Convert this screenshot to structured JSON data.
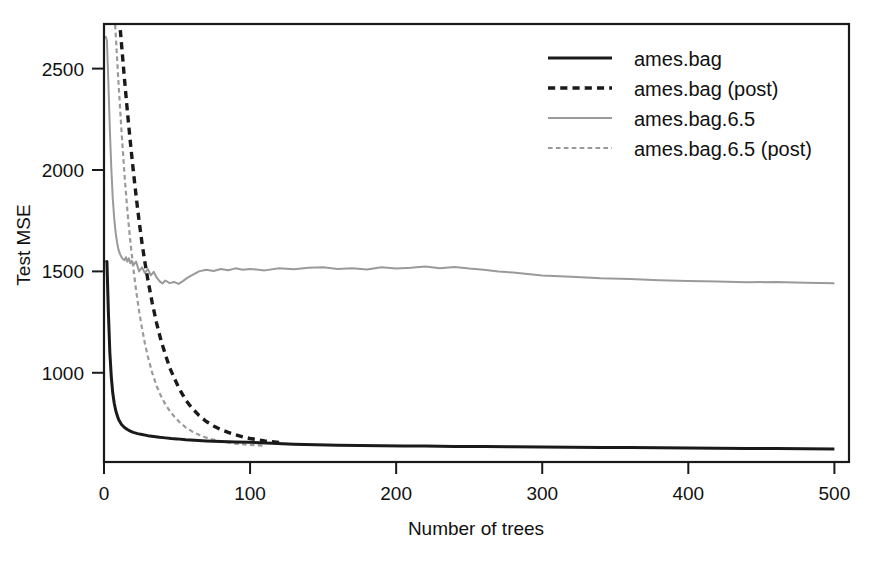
{
  "chart_data": {
    "type": "line",
    "title": "",
    "xlabel": "Number of trees",
    "ylabel": "Test MSE",
    "xlim": [
      0,
      510
    ],
    "ylim": [
      560,
      2720
    ],
    "xticks": [
      0,
      100,
      200,
      300,
      400,
      500
    ],
    "xticklabels": [
      "0",
      "100",
      "200",
      "300",
      "400",
      "500"
    ],
    "yticks": [
      1000,
      1500,
      2000,
      2500
    ],
    "yticklabels": [
      "1000",
      "1500",
      "2000",
      "2500"
    ],
    "grid": false,
    "legend_position": "top-right",
    "colors": {
      "black": "#1a1a1a",
      "gray": "#9a9a9a",
      "frame": "#1a1a1a",
      "background": "#ffffff"
    },
    "series": [
      {
        "name": "ames.bag",
        "color": "#1a1a1a",
        "dash": "solid",
        "width": 3.0,
        "x": [
          1,
          2,
          3,
          4,
          5,
          6,
          7,
          8,
          9,
          10,
          12,
          14,
          16,
          18,
          20,
          23,
          26,
          30,
          34,
          38,
          42,
          46,
          50,
          56,
          62,
          70,
          80,
          90,
          100,
          115,
          130,
          145,
          160,
          175,
          190,
          205,
          220,
          240,
          260,
          280,
          300,
          320,
          340,
          360,
          380,
          400,
          420,
          440,
          460,
          480,
          500
        ],
        "y": [
          1545,
          1548,
          1300,
          1100,
          980,
          900,
          850,
          815,
          790,
          770,
          745,
          730,
          720,
          712,
          706,
          700,
          696,
          690,
          686,
          682,
          679,
          676,
          674,
          670,
          667,
          664,
          661,
          659,
          657,
          652,
          648,
          645,
          643,
          641,
          640,
          639,
          639,
          637,
          636,
          635,
          634,
          633,
          632,
          631,
          630,
          629,
          628,
          627,
          626,
          625,
          624
        ]
      },
      {
        "name": "ames.bag (post)",
        "color": "#1a1a1a",
        "dash": "dashed",
        "width": 3.4,
        "x": [
          1,
          2,
          3,
          4,
          5,
          6,
          7,
          8,
          9,
          10,
          12,
          14,
          16,
          18,
          20,
          22,
          24,
          26,
          28,
          30,
          33,
          36,
          39,
          42,
          45,
          48,
          52,
          56,
          60,
          65,
          70,
          75,
          80,
          85,
          90,
          95,
          100,
          110,
          120
        ],
        "y": [
          3350,
          3300,
          3250,
          3200,
          3140,
          3080,
          3020,
          2950,
          2870,
          2790,
          2620,
          2450,
          2290,
          2140,
          2000,
          1870,
          1750,
          1640,
          1545,
          1460,
          1345,
          1245,
          1160,
          1090,
          1025,
          975,
          915,
          865,
          828,
          790,
          760,
          738,
          720,
          706,
          694,
          684,
          676,
          664,
          656
        ]
      },
      {
        "name": "ames.bag.6.5",
        "color": "#9a9a9a",
        "dash": "solid",
        "width": 2.0,
        "x": [
          1,
          2,
          3,
          4,
          5,
          6,
          7,
          8,
          9,
          10,
          11,
          12,
          13,
          14,
          15,
          16,
          17,
          18,
          19,
          20,
          22,
          24,
          26,
          28,
          30,
          32,
          34,
          36,
          38,
          40,
          42,
          45,
          48,
          51,
          54,
          57,
          60,
          65,
          70,
          75,
          80,
          85,
          90,
          95,
          100,
          110,
          120,
          130,
          140,
          150,
          160,
          170,
          180,
          190,
          200,
          210,
          220,
          230,
          240,
          250,
          260,
          270,
          280,
          290,
          300,
          320,
          340,
          360,
          380,
          400,
          420,
          440,
          460,
          480,
          500
        ],
        "y": [
          2660,
          2640,
          2430,
          2200,
          2010,
          1860,
          1760,
          1690,
          1640,
          1605,
          1585,
          1570,
          1560,
          1555,
          1570,
          1548,
          1565,
          1540,
          1552,
          1530,
          1548,
          1500,
          1520,
          1492,
          1512,
          1480,
          1498,
          1470,
          1452,
          1440,
          1455,
          1442,
          1448,
          1438,
          1452,
          1468,
          1480,
          1500,
          1508,
          1502,
          1512,
          1506,
          1515,
          1508,
          1512,
          1505,
          1516,
          1510,
          1518,
          1520,
          1512,
          1516,
          1509,
          1520,
          1514,
          1518,
          1524,
          1516,
          1522,
          1514,
          1508,
          1500,
          1494,
          1487,
          1480,
          1474,
          1466,
          1462,
          1456,
          1452,
          1450,
          1446,
          1448,
          1444,
          1442
        ]
      },
      {
        "name": "ames.bag.6.5 (post)",
        "color": "#9a9a9a",
        "dash": "dashed",
        "width": 2.2,
        "x": [
          1,
          2,
          3,
          4,
          5,
          6,
          7,
          8,
          9,
          10,
          12,
          14,
          16,
          18,
          20,
          22,
          24,
          26,
          28,
          30,
          33,
          36,
          39,
          42,
          45,
          48,
          52,
          56,
          60,
          65,
          70,
          75,
          80,
          85,
          90,
          100,
          110
        ],
        "y": [
          3300,
          3240,
          3170,
          3090,
          3000,
          2900,
          2790,
          2670,
          2545,
          2420,
          2190,
          1980,
          1800,
          1650,
          1520,
          1405,
          1305,
          1220,
          1145,
          1080,
          1000,
          935,
          885,
          845,
          812,
          785,
          755,
          730,
          712,
          694,
          680,
          670,
          662,
          656,
          651,
          644,
          640
        ]
      }
    ],
    "legend": [
      {
        "label": "ames.bag",
        "color": "#1a1a1a",
        "dash": "solid",
        "width": 3.0
      },
      {
        "label": "ames.bag (post)",
        "color": "#1a1a1a",
        "dash": "dashed",
        "width": 3.4
      },
      {
        "label": "ames.bag.6.5",
        "color": "#9a9a9a",
        "dash": "solid",
        "width": 2.0
      },
      {
        "label": "ames.bag.6.5 (post)",
        "color": "#9a9a9a",
        "dash": "dashed",
        "width": 2.2
      }
    ]
  }
}
